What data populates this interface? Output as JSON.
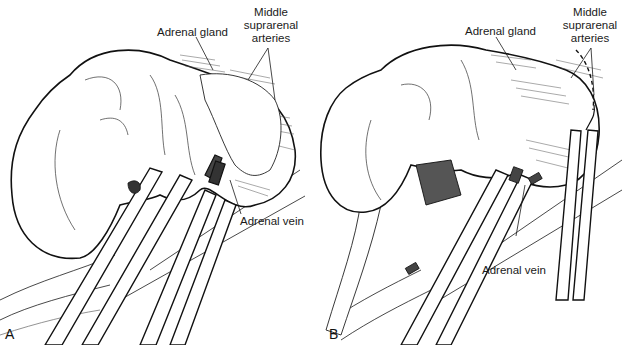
{
  "figure": {
    "panels": [
      {
        "id": "A",
        "letter": "A",
        "labels": {
          "adrenal_gland": "Adrenal gland",
          "middle_suprarenal_arteries": [
            "Middle",
            "suprarenal",
            "arteries"
          ],
          "adrenal_vein": "Adrenal vein"
        }
      },
      {
        "id": "B",
        "letter": "B",
        "labels": {
          "adrenal_gland": "Adrenal gland",
          "middle_suprarenal_arteries": [
            "Middle",
            "suprarenal",
            "arteries"
          ],
          "adrenal_vein": "Adrenal vein"
        }
      }
    ],
    "colors": {
      "ink": "#1a1a1a",
      "background": "#ffffff",
      "hatch": "#555555"
    }
  }
}
